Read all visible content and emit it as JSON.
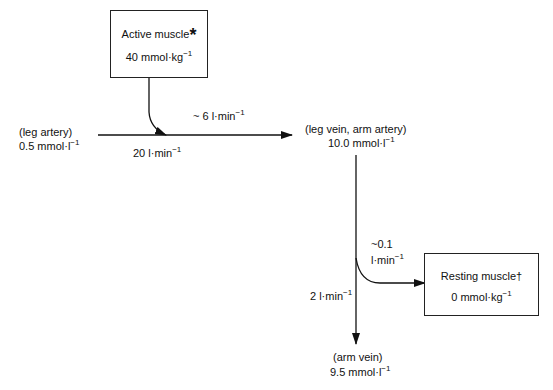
{
  "diagram": {
    "nodes": {
      "active_muscle": {
        "title": "Active muscle",
        "mark": "*",
        "value": "40 mmol·kg",
        "exp": "−1"
      },
      "resting_muscle": {
        "title": "Resting muscle",
        "mark": "†",
        "value": "0 mmol·kg",
        "exp": "−1"
      },
      "leg_artery": {
        "label": "(leg artery)",
        "value": "0.5  mmol·l",
        "exp": "−1"
      },
      "leg_vein_arm_artery": {
        "label": "(leg vein, arm artery)",
        "value": "10.0 mmol·l",
        "exp": "−1"
      },
      "arm_vein": {
        "label": "(arm vein)",
        "value": "9.5  mmol·l",
        "exp": "−1"
      }
    },
    "flows": {
      "active_to_blood": {
        "value": "~ 6 l·min",
        "exp": "−1"
      },
      "leg_blood_flow": {
        "value": "20 l·min",
        "exp": "−1"
      },
      "to_resting": {
        "value1": "~0.1",
        "value2": "l·min",
        "exp": "−1"
      },
      "arm_blood_flow": {
        "value": "2 l·min",
        "exp": "−1"
      }
    },
    "colors": {
      "line": "#111111",
      "background": "#ffffff"
    }
  }
}
